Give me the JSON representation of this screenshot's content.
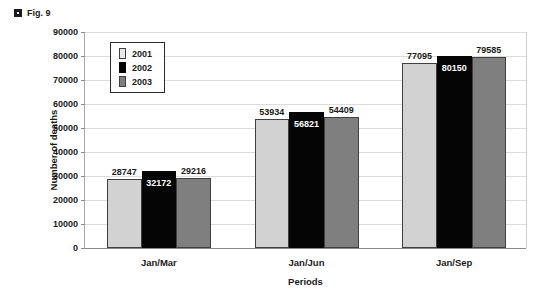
{
  "figure": {
    "marker_icon": "figure-marker-icon",
    "caption": "Fig. 9"
  },
  "chart_data": {
    "type": "bar",
    "title": "",
    "categories": [
      "Jan/Mar",
      "Jan/Jun",
      "Jan/Sep"
    ],
    "series": [
      {
        "name": "2001",
        "color": "#d2d2d2",
        "values": [
          28747,
          53934,
          77095
        ]
      },
      {
        "name": "2002",
        "color": "#050505",
        "values": [
          32172,
          56821,
          80150
        ]
      },
      {
        "name": "2003",
        "color": "#7f7f7f",
        "values": [
          29216,
          54409,
          79585
        ]
      }
    ],
    "xlabel": "Periods",
    "ylabel": "Number of deaths",
    "ylim": [
      0,
      90000
    ],
    "ytick_step": 10000,
    "yticks": [
      0,
      10000,
      20000,
      30000,
      40000,
      50000,
      60000,
      70000,
      80000,
      90000
    ],
    "ytick_labels": [
      "0",
      "10000",
      "20000",
      "30000",
      "40000",
      "50000",
      "60000",
      "70000",
      "80000",
      "90000"
    ],
    "grid": true,
    "legend_position": "upper-left-inside",
    "data_labels": {
      "Jan/Mar": [
        "28747",
        "32172",
        "29216"
      ],
      "Jan/Jun": [
        "53934",
        "56821",
        "54409"
      ],
      "Jan/Sep": [
        "77095",
        "80150",
        "79585"
      ]
    }
  }
}
